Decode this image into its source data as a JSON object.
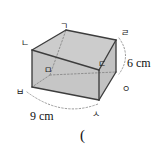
{
  "figure": {
    "type": "rectangular-prism",
    "shape_name": "cuboid",
    "fill_color": "#c9c9c9",
    "edge_color": "#3a3a3a",
    "hidden_edge_color": "#8a8a8a",
    "background": "#ffffff",
    "vertices": [
      {
        "id": "vertex-g",
        "label": "ㄱ",
        "x": 60,
        "y": 22,
        "kind": "top-back-left"
      },
      {
        "id": "vertex-n",
        "label": "ㄴ",
        "x": 21,
        "y": 39,
        "kind": "top-front-left"
      },
      {
        "id": "vertex-d",
        "label": "ㄷ",
        "x": 98,
        "y": 60,
        "kind": "top-front-right"
      },
      {
        "id": "vertex-r",
        "label": "ㄹ",
        "x": 121,
        "y": 29,
        "kind": "top-back-right"
      },
      {
        "id": "vertex-m",
        "label": "ㅁ",
        "x": 44,
        "y": 66,
        "kind": "bottom-back-left-hidden"
      },
      {
        "id": "vertex-b",
        "label": "ㅂ",
        "x": 16,
        "y": 88,
        "kind": "bottom-front-left"
      },
      {
        "id": "vertex-s",
        "label": "ㅅ",
        "x": 92,
        "y": 110,
        "kind": "bottom-front-right"
      },
      {
        "id": "vertex-o",
        "label": "ㅇ",
        "x": 122,
        "y": 85,
        "kind": "bottom-back-right"
      }
    ],
    "dimensions": [
      {
        "id": "height-dim",
        "value": "6 cm",
        "orientation": "vertical",
        "x": 127,
        "y": 57
      },
      {
        "id": "width-dim",
        "value": "9 cm",
        "orientation": "horizontal",
        "x": 30,
        "y": 110
      }
    ],
    "answer_marker": {
      "text": "(",
      "x": 80,
      "y": 128
    }
  }
}
